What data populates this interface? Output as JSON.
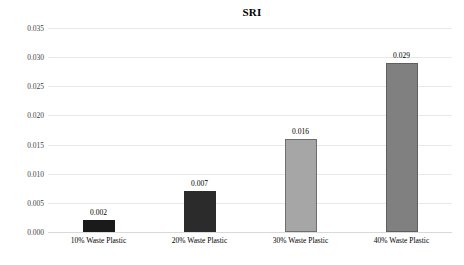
{
  "chart_data": {
    "type": "bar",
    "title": "SRI",
    "xlabel": "",
    "ylabel": "",
    "categories": [
      "10% Waste Plastic",
      "20% Waste Plastic",
      "30% Waste Plastic",
      "40% Waste Plastic"
    ],
    "values": [
      0.002,
      0.007,
      0.016,
      0.029
    ],
    "value_labels": [
      "0.002",
      "0.007",
      "0.016",
      "0.029"
    ],
    "bar_colors": [
      "#1a1a1a",
      "#2b2b2b",
      "#a6a6a6",
      "#808080"
    ],
    "bar_borders": [
      "#1a1a1a",
      "#2b2b2b",
      "#6e6e6e",
      "#5f5f5f"
    ],
    "ylim": [
      0.0,
      0.035
    ],
    "ytick_values": [
      0.0,
      0.005,
      0.01,
      0.015,
      0.02,
      0.025,
      0.03,
      0.035
    ],
    "ytick_labels": [
      "0.000",
      "0.005",
      "0.010",
      "0.015",
      "0.020",
      "0.025",
      "0.030",
      "0.035"
    ],
    "grid": true,
    "grid_axis": "y",
    "legend": false,
    "legend_position": "none",
    "background_color": "#ffffff",
    "gridline_color": "#e8e8e8"
  }
}
